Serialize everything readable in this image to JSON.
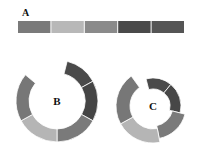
{
  "panels": [
    {
      "id": "A",
      "label": "A",
      "kind": "strip",
      "segments": [
        {
          "color": "#7a7a7a",
          "share": 1
        },
        {
          "color": "#b8b8b8",
          "share": 1
        },
        {
          "color": "#8a8a8a",
          "share": 1
        },
        {
          "color": "#4a4a4a",
          "share": 1
        },
        {
          "color": "#555555",
          "share": 1
        }
      ]
    },
    {
      "id": "B",
      "label": "B",
      "kind": "ring",
      "segments": [
        {
          "color": "#4a4a4a",
          "share": 0.13
        },
        {
          "color": "#454545",
          "share": 0.16
        },
        {
          "color": "#7a7a7a",
          "share": 0.17
        },
        {
          "color": "#b5b5b5",
          "share": 0.17
        },
        {
          "color": "#777777",
          "share": 0.19
        }
      ],
      "gap_share": 0.18
    },
    {
      "id": "C",
      "label": "C",
      "kind": "spiral",
      "segments": [
        {
          "color": "#4a4a4a",
          "share": 0.15,
          "level": 1
        },
        {
          "color": "#474747",
          "share": 0.18,
          "level": 1
        },
        {
          "color": "#7a7a7a",
          "share": 0.18,
          "level": 2
        },
        {
          "color": "#b5b5b5",
          "share": 0.2,
          "level": 3
        },
        {
          "color": "#777777",
          "share": 0.23,
          "level": 3
        }
      ]
    }
  ]
}
